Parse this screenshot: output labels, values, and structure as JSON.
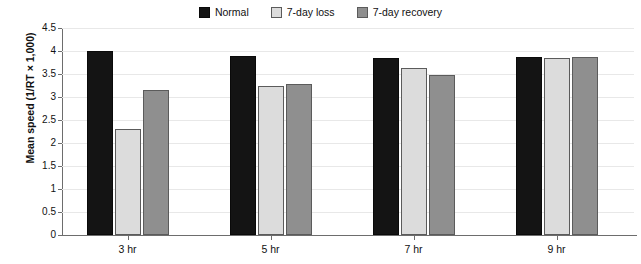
{
  "chart_data": {
    "type": "bar",
    "title": "",
    "xlabel": "",
    "ylabel": "Mean speed (1/RT × 1,000)",
    "categories": [
      "3 hr",
      "5 hr",
      "7 hr",
      "9 hr"
    ],
    "series": [
      {
        "name": "Normal",
        "color": "#141414",
        "values": [
          4.0,
          3.9,
          3.85,
          3.88
        ]
      },
      {
        "name": "7-day loss",
        "color": "#dcdcdc",
        "values": [
          2.3,
          3.25,
          3.62,
          3.85
        ]
      },
      {
        "name": "7-day recovery",
        "color": "#8f8f8f",
        "values": [
          3.15,
          3.28,
          3.48,
          3.86
        ]
      }
    ],
    "ylim": [
      0,
      4.5
    ],
    "yticks": [
      0,
      0.5,
      1,
      1.5,
      2,
      2.5,
      3,
      3.5,
      4,
      4.5
    ],
    "ytick_labels": [
      "0",
      "0.5",
      "1",
      "1.5",
      "2",
      "2.5",
      "3",
      "3.5",
      "4",
      "4.5"
    ],
    "grid": true,
    "grid_axis": "y",
    "legend_position": "top-center"
  },
  "legend": {
    "items": [
      {
        "label": "Normal",
        "swatch": "legend-swatch-normal",
        "color": "#141414"
      },
      {
        "label": "7-day loss",
        "swatch": "legend-swatch-7-day-loss",
        "color": "#dcdcdc"
      },
      {
        "label": "7-day recovery",
        "swatch": "legend-swatch-7-day-recovery",
        "color": "#8f8f8f"
      }
    ]
  }
}
